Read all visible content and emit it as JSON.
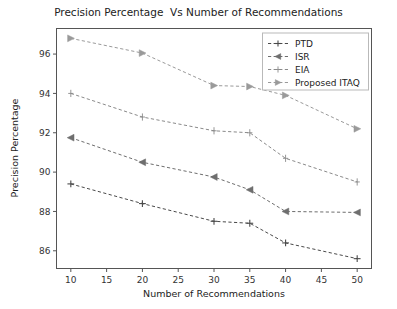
{
  "chart_data": {
    "type": "line",
    "title": "Precision Percentage  Vs Number of Recommendations",
    "xlabel": "Number of Recommendations",
    "ylabel": "Precision Percentage",
    "x": [
      10,
      20,
      30,
      35,
      40,
      50
    ],
    "xlim": [
      8,
      52
    ],
    "ylim": [
      85.1,
      97.3
    ],
    "xticks": [
      10,
      15,
      20,
      25,
      30,
      35,
      40,
      45,
      50
    ],
    "xtick_labels": [
      "10",
      "15",
      "20",
      "25",
      "30",
      "35",
      "40",
      "45",
      "50"
    ],
    "yticks": [
      86,
      88,
      90,
      92,
      94,
      96
    ],
    "ytick_labels": [
      "86",
      "88",
      "90",
      "92",
      "94",
      "96"
    ],
    "grid": false,
    "legend_position": "upper right",
    "series": [
      {
        "name": "PTD",
        "marker": "plus",
        "color": "#4a4a4a",
        "values": [
          89.4,
          88.4,
          87.5,
          87.4,
          86.4,
          85.6
        ]
      },
      {
        "name": "ISR",
        "marker": "triangle-left",
        "color": "#6e6e6e",
        "values": [
          91.75,
          90.5,
          89.75,
          89.1,
          88.0,
          87.95
        ]
      },
      {
        "name": "EIA",
        "marker": "plus-thin",
        "color": "#8a8a8a",
        "values": [
          94.0,
          92.8,
          92.1,
          92.0,
          90.7,
          89.5
        ]
      },
      {
        "name": "Proposed ITAQ",
        "marker": "triangle-right",
        "color": "#9a9a9a",
        "values": [
          96.8,
          96.05,
          94.4,
          94.35,
          93.9,
          92.2
        ]
      }
    ]
  },
  "legend": {
    "entries": [
      "PTD",
      "ISR",
      "EIA",
      "Proposed ITAQ"
    ]
  }
}
